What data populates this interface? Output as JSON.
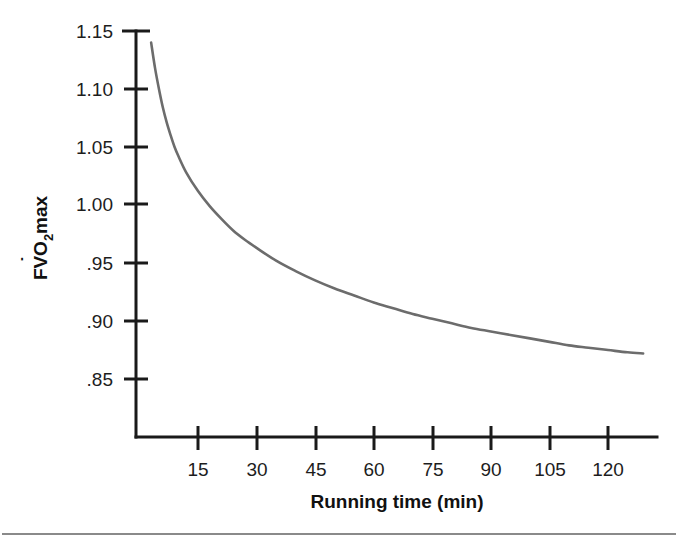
{
  "figure": {
    "background_color": "#ffffff",
    "curve_color": "#6c6c6c",
    "axis_color": "#1a1a1a",
    "rule_color": "#8a8a8a"
  },
  "chart_data": {
    "type": "line",
    "title": "",
    "xlabel": "Running time (min)",
    "ylabel": "FVO2 max",
    "ylabel_parts": {
      "prefix": "FV",
      "dot_over": "V",
      "base": "O",
      "subscript": "2",
      "suffix": " max"
    },
    "xlim": [
      0,
      130
    ],
    "ylim": [
      0.82,
      1.15
    ],
    "xticks": [
      15,
      30,
      45,
      60,
      75,
      90,
      105,
      120
    ],
    "xtick_labels": [
      "15",
      "30",
      "45",
      "60",
      "75",
      "90",
      "105",
      "120"
    ],
    "yticks": [
      0.85,
      0.9,
      0.95,
      1.0,
      1.05,
      1.1,
      1.15
    ],
    "ytick_labels": [
      ".85",
      ".90",
      ".95",
      "1.00",
      "1.05",
      "1.10",
      "1.15"
    ],
    "grid": false,
    "legend": false,
    "series": [
      {
        "name": "FVO2 max vs running time",
        "x": [
          3,
          4,
          5,
          6,
          7,
          8,
          9,
          10,
          12,
          15,
          18,
          21,
          24,
          27,
          30,
          35,
          40,
          45,
          50,
          55,
          60,
          65,
          70,
          75,
          80,
          85,
          90,
          95,
          100,
          105,
          110,
          115,
          120,
          125,
          129
        ],
        "values": [
          1.14,
          1.118,
          1.1,
          1.084,
          1.071,
          1.06,
          1.05,
          1.042,
          1.028,
          1.012,
          0.999,
          0.988,
          0.978,
          0.97,
          0.963,
          0.952,
          0.943,
          0.935,
          0.928,
          0.922,
          0.916,
          0.911,
          0.906,
          0.902,
          0.898,
          0.894,
          0.891,
          0.888,
          0.885,
          0.882,
          0.879,
          0.877,
          0.875,
          0.873,
          0.872
        ]
      }
    ]
  }
}
